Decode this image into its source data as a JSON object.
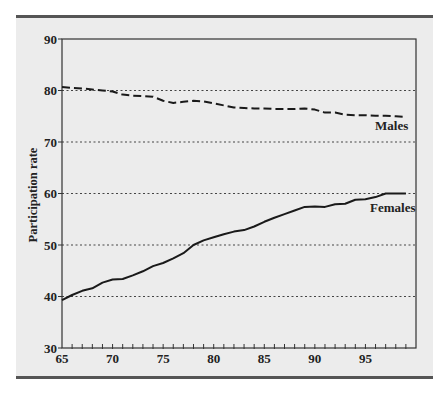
{
  "chart_data": {
    "type": "line",
    "title": "",
    "xlabel": "",
    "ylabel": "Participation rate",
    "xlim": [
      65,
      100
    ],
    "ylim": [
      30,
      90
    ],
    "x_ticks": [
      65,
      70,
      75,
      80,
      85,
      90,
      95
    ],
    "y_ticks": [
      30,
      40,
      50,
      60,
      70,
      80,
      90
    ],
    "grid": {
      "horizontal": true,
      "style": "dotted",
      "values": [
        40,
        50,
        60,
        70,
        80
      ]
    },
    "legend": "inline labels",
    "x": [
      65,
      66,
      67,
      68,
      69,
      70,
      71,
      72,
      73,
      74,
      75,
      76,
      77,
      78,
      79,
      80,
      81,
      82,
      83,
      84,
      85,
      86,
      87,
      88,
      89,
      90,
      91,
      92,
      93,
      94,
      95,
      96,
      97,
      98,
      99
    ],
    "series": [
      {
        "name": "Males",
        "style": "dashed",
        "values": [
          80.7,
          80.5,
          80.4,
          80.2,
          80.0,
          79.8,
          79.2,
          79.0,
          78.9,
          78.8,
          78.0,
          77.6,
          77.8,
          78.0,
          77.9,
          77.5,
          77.1,
          76.7,
          76.6,
          76.5,
          76.5,
          76.4,
          76.4,
          76.4,
          76.5,
          76.3,
          75.7,
          75.7,
          75.3,
          75.2,
          75.2,
          75.1,
          75.1,
          75.0,
          74.9
        ]
      },
      {
        "name": "Females",
        "style": "solid",
        "values": [
          39.3,
          40.3,
          41.1,
          41.6,
          42.7,
          43.3,
          43.4,
          44.1,
          44.9,
          45.9,
          46.5,
          47.4,
          48.4,
          50.0,
          50.9,
          51.5,
          52.1,
          52.6,
          52.9,
          53.6,
          54.5,
          55.3,
          56.0,
          56.7,
          57.4,
          57.5,
          57.4,
          57.9,
          58.0,
          58.8,
          58.9,
          59.3,
          60.0,
          60.0,
          60.0
        ]
      }
    ],
    "annotations": [
      {
        "text": "Males",
        "x": 96,
        "y": 72.5
      },
      {
        "text": "Females",
        "x": 96,
        "y": 56.4
      }
    ]
  },
  "labels": {
    "ylabel": "Participation rate",
    "males": "Males",
    "females": "Females"
  }
}
